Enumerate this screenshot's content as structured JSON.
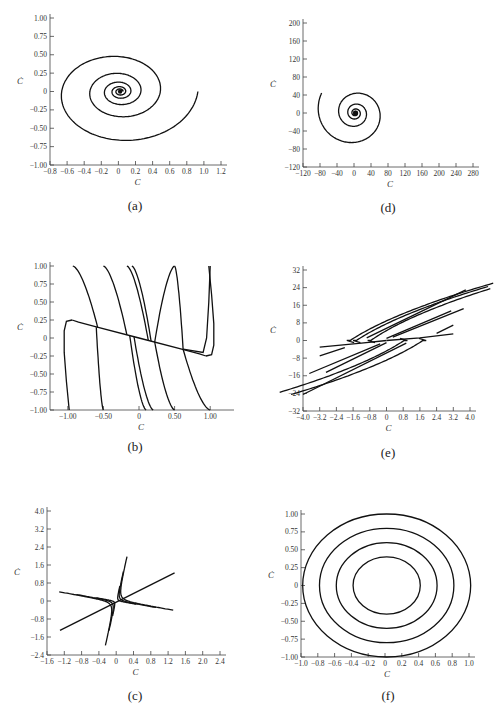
{
  "figure": {
    "panels_layout": "3 rows x 2 columns",
    "order": [
      "a",
      "d",
      "b",
      "e",
      "c",
      "f"
    ]
  },
  "chart_data": [
    {
      "id": "a",
      "caption": "(a)",
      "type": "line",
      "subtype": "phase-portrait-stable-spiral",
      "title": "",
      "xlabel": "C",
      "ylabel": "Ċ",
      "xlim": [
        -0.8,
        1.2
      ],
      "ylim": [
        -1.0,
        1.0
      ],
      "xticks": [
        "-0.8",
        "-0.6",
        "-0.4",
        "-0.2",
        "0",
        "0.2",
        "0.4",
        "0.6",
        "0.8",
        "1.0",
        "1.2"
      ],
      "yticks": [
        "1.00",
        "0.75",
        "0.50",
        "0.25",
        "0",
        "-0.25",
        "-0.50",
        "-0.75",
        "-1.00"
      ],
      "grid": false,
      "trajectory": {
        "start": [
          1.0,
          0.0
        ],
        "end": [
          0.0,
          0.0
        ],
        "turns": 5,
        "decay": 0.52,
        "leftmost_x": -0.82,
        "min_y": -0.87,
        "max_y": 0.63
      }
    },
    {
      "id": "d",
      "caption": "(d)",
      "type": "line",
      "subtype": "phase-portrait-unstable-spiral",
      "title": "",
      "xlabel": "C",
      "ylabel": "Ċ",
      "xlim": [
        -120,
        280
      ],
      "ylim": [
        -120,
        200
      ],
      "xticks": [
        "-120",
        "-80",
        "-40",
        "0",
        "40",
        "80",
        "120",
        "160",
        "200",
        "240",
        "280"
      ],
      "yticks": [
        "200",
        "160",
        "120",
        "80",
        "40",
        "0",
        "-40",
        "-80",
        "-120"
      ],
      "grid": false,
      "trajectory": {
        "start": [
          0,
          0
        ],
        "end": [
          135,
          72
        ],
        "turns": 5,
        "leftmost_x": -112,
        "min_y": -100,
        "max_y": 135
      }
    },
    {
      "id": "b",
      "caption": "(b)",
      "type": "line",
      "subtype": "phase-portrait-overdamped",
      "title": "",
      "xlabel": "C",
      "ylabel": "Ċ",
      "xlim": [
        -1.25,
        1.25
      ],
      "ylim": [
        -1.0,
        1.0
      ],
      "xticks": [
        "-1.00",
        "-0.50",
        "0",
        "0.50",
        "1.00"
      ],
      "yticks": [
        "1.00",
        "0.75",
        "0.50",
        "0.25",
        "0",
        "-0.25",
        "-0.50",
        "-0.75",
        "-1.00"
      ],
      "grid": false,
      "slow_manifold": {
        "slope": -0.25,
        "from": [
          -1.0,
          0.25
        ],
        "to": [
          1.0,
          -0.25
        ]
      },
      "trajectories_top_start_x": [
        -0.93,
        -0.5,
        -0.17,
        -0.1,
        0.5,
        1.0
      ],
      "trajectories_bottom_start_x": [
        -1.0,
        -0.5,
        0.1,
        0.2,
        0.5,
        1.0
      ]
    },
    {
      "id": "e",
      "caption": "(e)",
      "type": "line",
      "subtype": "phase-portrait-saddle-like",
      "title": "",
      "xlabel": "C",
      "ylabel": "Ċ",
      "xlim": [
        -4.0,
        4.0
      ],
      "ylim": [
        -32,
        32
      ],
      "xticks": [
        "-4.0",
        "-3.2",
        "-2.4",
        "-1.6",
        "-0.8",
        "0",
        "0.8",
        "1.6",
        "2.4",
        "3.2",
        "4.0"
      ],
      "yticks": [
        "32",
        "24",
        "16",
        "8",
        "0",
        "-8",
        "-16",
        "-24",
        "-32"
      ],
      "grid": false,
      "asymptotic_slope": 6.0
    },
    {
      "id": "c",
      "caption": "(c)",
      "type": "line",
      "subtype": "phase-portrait-saddle",
      "title": "",
      "xlabel": "C",
      "ylabel": "Ċ",
      "xlim": [
        -1.6,
        2.4
      ],
      "ylim": [
        -2.4,
        4.0
      ],
      "xticks": [
        "-1.6",
        "-1.2",
        "-0.8",
        "-0.4",
        "0",
        "0.4",
        "0.8",
        "1.2",
        "1.6",
        "2.0",
        "2.4"
      ],
      "yticks": [
        "4.0",
        "3.2",
        "2.4",
        "1.6",
        "0.8",
        "0",
        "-0.8",
        "-1.6",
        "-2.4"
      ],
      "grid": false,
      "unstable_manifold": {
        "from": [
          -1.3,
          -1.3
        ],
        "to": [
          1.35,
          1.25
        ]
      },
      "stable_direction_slope": -2.0,
      "hyperbola_count": 6
    },
    {
      "id": "f",
      "caption": "(f)",
      "type": "line",
      "subtype": "phase-portrait-center",
      "title": "",
      "xlabel": "C",
      "ylabel": "Ċ",
      "xlim": [
        -1.0,
        1.0
      ],
      "ylim": [
        -1.0,
        1.0
      ],
      "xticks": [
        "-1.0",
        "-0.8",
        "-0.6",
        "-0.4",
        "-0.2",
        "0",
        "0.2",
        "0.4",
        "0.6",
        "0.8",
        "1.0"
      ],
      "yticks": [
        "1.00",
        "0.75",
        "0.50",
        "0.25",
        "0",
        "-0.25",
        "-0.50",
        "-0.75",
        "-1.00"
      ],
      "grid": false,
      "ellipses": [
        {
          "rx": 1.0,
          "ry": 1.0
        },
        {
          "rx": 0.8,
          "ry": 0.8
        },
        {
          "rx": 0.6,
          "ry": 0.6
        },
        {
          "rx": 0.4,
          "ry": 0.4
        }
      ]
    }
  ],
  "panel_boxes": {
    "a": {
      "x0": 50,
      "x1": 221,
      "y0": 165,
      "y1": 18,
      "xmin": -0.8,
      "xmax": 1.2,
      "ymin": -1.0,
      "ymax": 1.0,
      "cap": [
        135,
        210
      ]
    },
    "d": {
      "x0": 303,
      "x1": 473,
      "y0": 167,
      "y1": 23,
      "xmin": -120,
      "xmax": 280,
      "ymin": -120,
      "ymax": 200,
      "cap": [
        388,
        212
      ]
    },
    "b": {
      "x0": 50,
      "x1": 228,
      "y0": 410,
      "y1": 266,
      "xmin": -1.25,
      "xmax": 1.25,
      "ymin": -1.0,
      "ymax": 1.0,
      "cap": [
        135,
        451
      ]
    },
    "e": {
      "x0": 303,
      "x1": 470,
      "y0": 411,
      "y1": 270,
      "xmin": -4.0,
      "xmax": 4.0,
      "ymin": -32,
      "ymax": 32,
      "cap": [
        388,
        457
      ]
    },
    "c": {
      "x0": 47,
      "x1": 220,
      "y0": 655,
      "y1": 511,
      "xmin": -1.6,
      "xmax": 2.4,
      "ymin": -2.4,
      "ymax": 4.0,
      "cap": [
        135,
        700
      ]
    },
    "f": {
      "x0": 301,
      "x1": 469,
      "y0": 657,
      "y1": 514,
      "xmin": -1.0,
      "xmax": 1.0,
      "ymin": -1.0,
      "ymax": 1.0,
      "cap": [
        388,
        700
      ]
    }
  }
}
